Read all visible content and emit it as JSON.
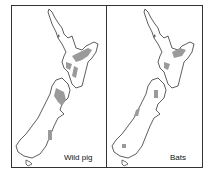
{
  "figure": {
    "panels": [
      {
        "label": "Wild pig",
        "subject": "wild-pig-distribution"
      },
      {
        "label": "Bats",
        "subject": "bats-distribution"
      }
    ],
    "region": "New Zealand",
    "colors": {
      "outline": "#333333",
      "shading": "#9a9a9a",
      "background": "#ffffff"
    }
  }
}
